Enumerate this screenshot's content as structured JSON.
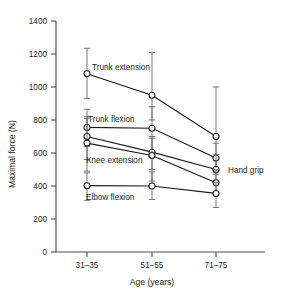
{
  "chart_data": {
    "type": "line",
    "title": "",
    "xlabel": "Age (years)",
    "ylabel": "Maximal force (N)",
    "categories": [
      "31–35",
      "51–55",
      "71–75"
    ],
    "ylim": [
      0,
      1400
    ],
    "yticks": [
      0,
      200,
      400,
      600,
      800,
      1000,
      1200,
      1400
    ],
    "ytick_labels": [
      "0",
      "200",
      "400",
      "600",
      "800",
      "1000",
      "1200",
      "1400"
    ],
    "grid": false,
    "legend": "inline-labels",
    "errorbars": "present",
    "series": [
      {
        "name": "Trunk extension",
        "values": [
          1080,
          950,
          700
        ],
        "err_low": [
          930,
          800,
          480
        ],
        "err_high": [
          1235,
          1210,
          1000
        ]
      },
      {
        "name": "Trunk flexion",
        "values": [
          755,
          750,
          570
        ],
        "err_low": [
          640,
          610,
          470
        ],
        "err_high": [
          865,
          880,
          660
        ]
      },
      {
        "name": "Knee extension",
        "values": [
          700,
          605,
          500
        ],
        "err_low": [
          560,
          500,
          420
        ],
        "err_high": [
          820,
          700,
          590
        ]
      },
      {
        "name": "Hand grip",
        "values": [
          660,
          585,
          420
        ],
        "err_low": [
          490,
          430,
          350
        ],
        "err_high": [
          810,
          690,
          500
        ]
      },
      {
        "name": "Elbow flexion",
        "values": [
          402,
          400,
          355
        ],
        "err_low": [
          313,
          318,
          270
        ],
        "err_high": [
          480,
          485,
          420
        ]
      }
    ],
    "annotations": [
      {
        "text": "Trunk extension",
        "x": 92,
        "y": 70
      },
      {
        "text": "Trunk flexion",
        "x": 88,
        "y": 122
      },
      {
        "text": "Knee extension",
        "x": 86,
        "y": 163
      },
      {
        "text": "Elbow flexion",
        "x": 86,
        "y": 200
      },
      {
        "text": "Hand grip",
        "x": 228,
        "y": 173
      }
    ]
  },
  "caption": {
    "text": ""
  }
}
